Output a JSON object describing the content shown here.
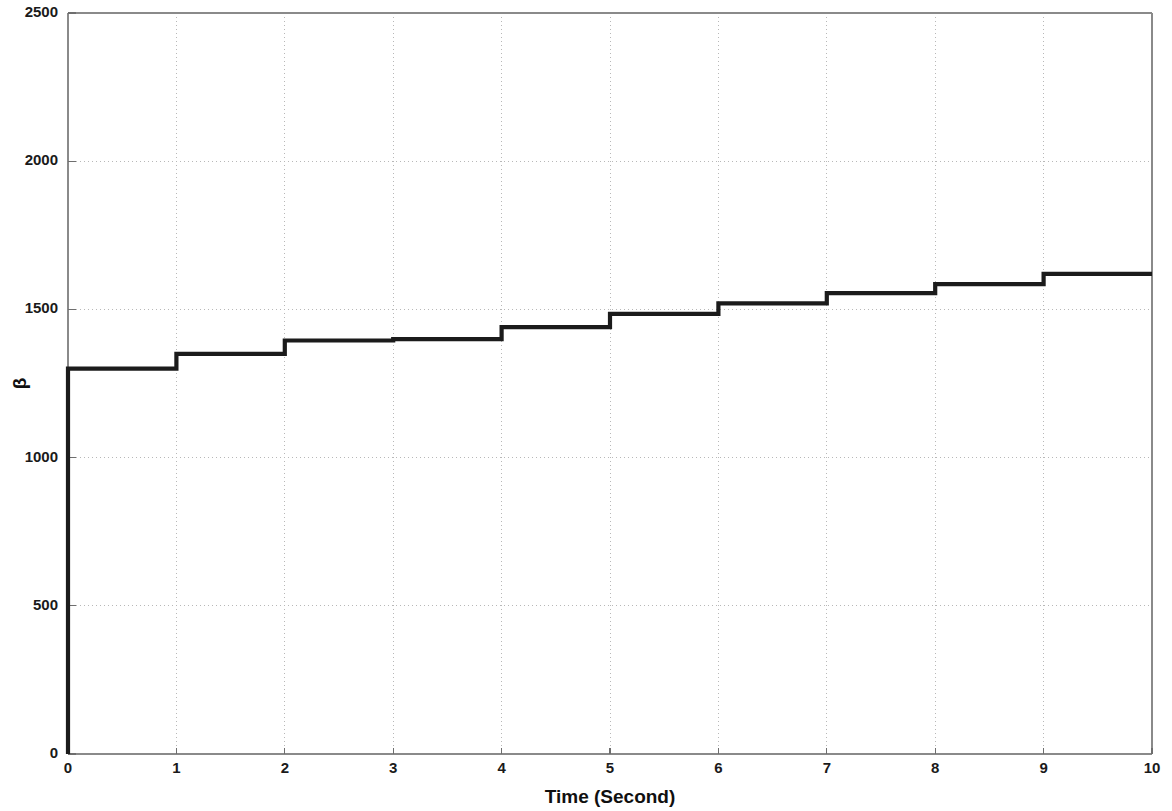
{
  "chart_data": {
    "type": "line",
    "subtype": "staircase",
    "title": "",
    "xlabel": "Time (Second)",
    "ylabel": "β",
    "xlim": [
      0,
      10
    ],
    "ylim": [
      0,
      2500
    ],
    "xticks": [
      "0",
      "1",
      "2",
      "3",
      "4",
      "5",
      "6",
      "7",
      "8",
      "9",
      "10"
    ],
    "yticks": [
      "0",
      "500",
      "1000",
      "1500",
      "2000",
      "2500"
    ],
    "xtick_values": [
      0,
      1,
      2,
      3,
      4,
      5,
      6,
      7,
      8,
      9,
      10
    ],
    "ytick_values": [
      0,
      500,
      1000,
      1500,
      2000,
      2500
    ],
    "grid": true,
    "legend": "none",
    "line_color": "#1b1b1b",
    "grid_color": "#b8b8b8",
    "axis_color": "#8a8a8a",
    "background_color": "#ffffff",
    "series": [
      {
        "name": "beta",
        "x": [
          0,
          0,
          1,
          1,
          2,
          2,
          3,
          3,
          4,
          4,
          5,
          5,
          6,
          6,
          7,
          7,
          8,
          8,
          9,
          9,
          10
        ],
        "values": [
          0,
          1300,
          1300,
          1350,
          1350,
          1395,
          1395,
          1400,
          1400,
          1440,
          1440,
          1485,
          1485,
          1520,
          1520,
          1555,
          1555,
          1585,
          1585,
          1620,
          1620
        ]
      }
    ],
    "step_levels": [
      1300,
      1350,
      1395,
      1400,
      1440,
      1485,
      1520,
      1555,
      1585,
      1620,
      1655
    ],
    "final_value": 1655,
    "initial_value": 1300
  },
  "figure": {
    "name": "beta-vs-time-staircase-plot"
  }
}
